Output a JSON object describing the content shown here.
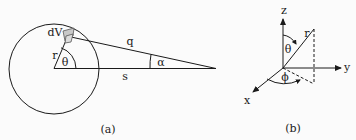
{
  "panel_a": {
    "labels": {
      "dV": "dV",
      "r": "r",
      "theta": "θ",
      "q": "q",
      "s": "s",
      "alpha": "α"
    },
    "caption": "(a)"
  },
  "panel_b": {
    "labels": {
      "z": "z",
      "y": "y",
      "x": "x",
      "r": "r",
      "theta": "θ",
      "phi": "ϕ"
    },
    "caption": "(b)"
  },
  "colors": {
    "stroke": "#1a1a1a",
    "volume_fill": "#c8c8c8"
  }
}
